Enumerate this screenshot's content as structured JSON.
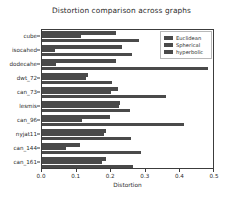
{
  "chart_data": {
    "type": "bar",
    "orientation": "horizontal",
    "title": "Distortion comparison across graphs",
    "xlabel": "Distortion",
    "ylabel": "",
    "xlim": [
      0.0,
      0.5
    ],
    "xticks": [
      "0.0",
      "0.1",
      "0.2",
      "0.3",
      "0.4",
      "0.5"
    ],
    "xtick_values": [
      0.0,
      0.1,
      0.2,
      0.3,
      0.4,
      0.5
    ],
    "grid": false,
    "legend_position": "upper right",
    "categories": [
      "cube",
      "isocahed",
      "dodecahe",
      "dwt_72",
      "can_73",
      "lesmis",
      "can_96",
      "nyjat11",
      "can_144",
      "can_161"
    ],
    "series": [
      {
        "name": "Euclidean",
        "color": "#4a4a4a",
        "values": [
          0.214,
          0.232,
          0.215,
          0.132,
          0.219,
          0.225,
          0.196,
          0.186,
          0.11,
          0.184
        ]
      },
      {
        "name": "Spherical",
        "color": "#4a4a4a",
        "values": [
          0.112,
          0.038,
          0.04,
          0.128,
          0.198,
          0.222,
          0.116,
          0.178,
          0.068,
          0.172
        ]
      },
      {
        "name": "hyperbolic",
        "color": "#4a4a4a",
        "values": [
          0.281,
          0.259,
          0.481,
          0.201,
          0.357,
          0.254,
          0.41,
          0.256,
          0.285,
          0.262
        ]
      }
    ]
  },
  "legend": {
    "entries": [
      "Euclidean",
      "Spherical",
      "hyperbolic"
    ]
  }
}
